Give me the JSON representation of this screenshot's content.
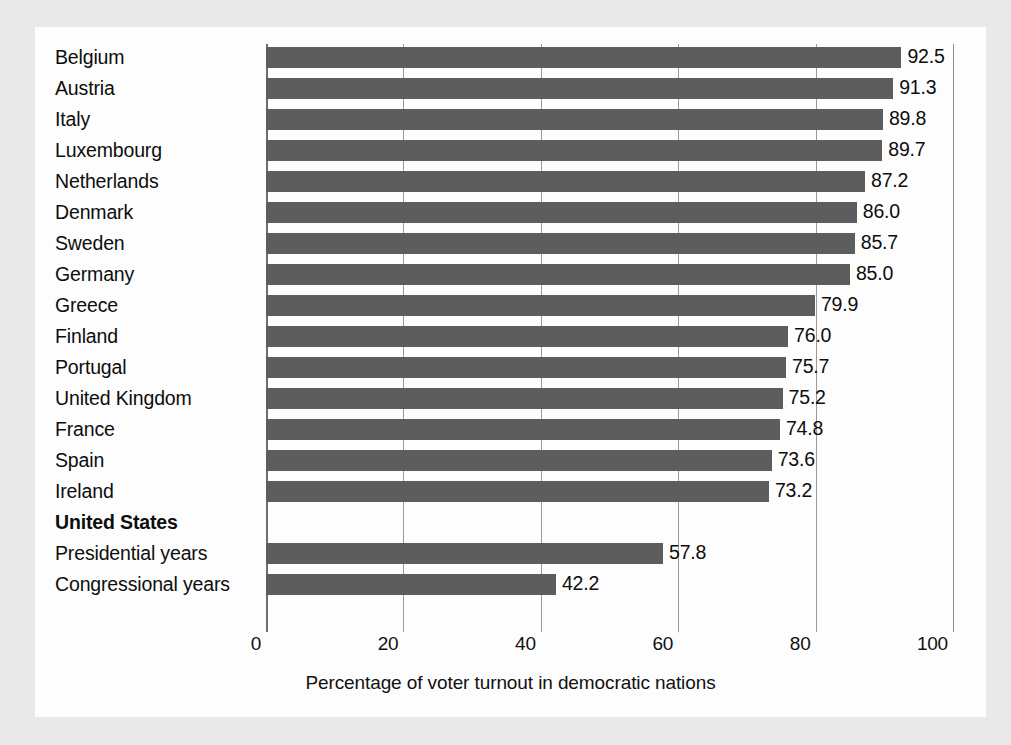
{
  "chart_data": {
    "type": "bar",
    "orientation": "horizontal",
    "title": "",
    "xlabel": "Percentage of voter turnout in democratic nations",
    "ylabel": "",
    "xlim": [
      0,
      100
    ],
    "xticks": [
      "0",
      "20",
      "40",
      "60",
      "80",
      "100"
    ],
    "xtick_values": [
      0,
      20,
      40,
      60,
      80,
      100
    ],
    "grid": true,
    "legend": "none",
    "bar_color": "#5d5d5d",
    "categories": [
      "Belgium",
      "Austria",
      "Italy",
      "Luxembourg",
      "Netherlands",
      "Denmark",
      "Sweden",
      "Germany",
      "Greece",
      "Finland",
      "Portugal",
      "United Kingdom",
      "France",
      "Spain",
      "Ireland",
      "United States",
      "Presidential years",
      "Congressional years"
    ],
    "values": [
      92.5,
      91.3,
      89.8,
      89.7,
      87.2,
      86.0,
      85.7,
      85.0,
      79.9,
      76.0,
      75.7,
      75.2,
      74.8,
      73.6,
      73.2,
      null,
      57.8,
      42.2
    ],
    "rows": [
      {
        "label": "Belgium",
        "value": 92.5,
        "value_label": "92.5",
        "style": "normal"
      },
      {
        "label": "Austria",
        "value": 91.3,
        "value_label": "91.3",
        "style": "normal"
      },
      {
        "label": "Italy",
        "value": 89.8,
        "value_label": "89.8",
        "style": "normal"
      },
      {
        "label": "Luxembourg",
        "value": 89.7,
        "value_label": "89.7",
        "style": "normal"
      },
      {
        "label": "Netherlands",
        "value": 87.2,
        "value_label": "87.2",
        "style": "normal"
      },
      {
        "label": "Denmark",
        "value": 86.0,
        "value_label": "86.0",
        "style": "normal"
      },
      {
        "label": "Sweden",
        "value": 85.7,
        "value_label": "85.7",
        "style": "normal"
      },
      {
        "label": "Germany",
        "value": 85.0,
        "value_label": "85.0",
        "style": "normal"
      },
      {
        "label": "Greece",
        "value": 79.9,
        "value_label": "79.9",
        "style": "normal"
      },
      {
        "label": "Finland",
        "value": 76.0,
        "value_label": "76.0",
        "style": "normal"
      },
      {
        "label": "Portugal",
        "value": 75.7,
        "value_label": "75.7",
        "style": "normal"
      },
      {
        "label": "United Kingdom",
        "value": 75.2,
        "value_label": "75.2",
        "style": "normal"
      },
      {
        "label": "France",
        "value": 74.8,
        "value_label": "74.8",
        "style": "normal"
      },
      {
        "label": "Spain",
        "value": 73.6,
        "value_label": "73.6",
        "style": "normal"
      },
      {
        "label": "Ireland",
        "value": 73.2,
        "value_label": "73.2",
        "style": "normal"
      },
      {
        "label": "United States",
        "value": null,
        "value_label": "",
        "style": "group"
      },
      {
        "label": "Presidential years",
        "value": 57.8,
        "value_label": "57.8",
        "style": "indent"
      },
      {
        "label": "Congressional years",
        "value": 42.2,
        "value_label": "42.2",
        "style": "indent"
      }
    ]
  }
}
